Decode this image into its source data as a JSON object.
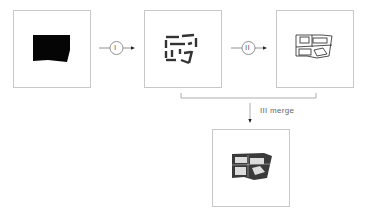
{
  "diagram": {
    "steps": [
      {
        "id": "input",
        "label": "",
        "icon": "solid-footprint-icon"
      },
      {
        "id": "step1",
        "label": "I",
        "icon": "dashed-outline-icon"
      },
      {
        "id": "step2",
        "label": "II",
        "icon": "line-plan-icon"
      },
      {
        "id": "step3",
        "label": "III merge",
        "icon": "merged-plan-icon"
      }
    ],
    "connectors": {
      "op1": "I",
      "op2": "II",
      "merge_label": "III  merge"
    },
    "colors": {
      "border": "#c8c8c8",
      "ink": "#111111",
      "line": "#555555"
    }
  }
}
